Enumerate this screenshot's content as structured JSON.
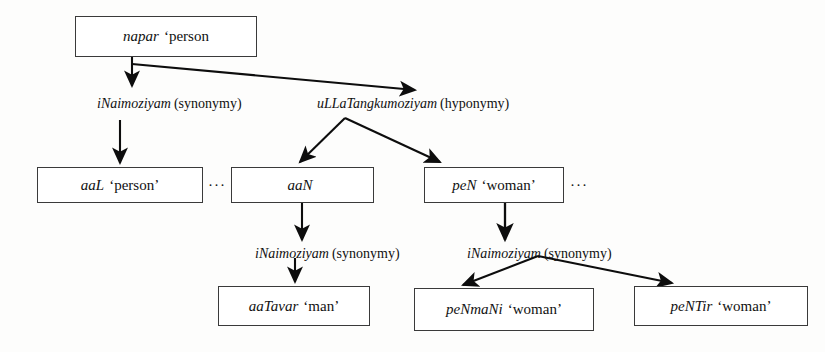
{
  "diagram": {
    "type": "tree",
    "nodes": [
      {
        "id": "napar",
        "term": "napar",
        "gloss": "‘person",
        "x": 75,
        "y": 16,
        "w": 182,
        "h": 41
      },
      {
        "id": "aaL",
        "term": "aaL",
        "gloss": "‘person’",
        "x": 37,
        "y": 167,
        "w": 166,
        "h": 36
      },
      {
        "id": "aaN",
        "term": "aaN",
        "gloss": "",
        "x": 231,
        "y": 167,
        "w": 143,
        "h": 36
      },
      {
        "id": "peN",
        "term": "peN",
        "gloss": "‘woman’",
        "x": 424,
        "y": 167,
        "w": 140,
        "h": 36
      },
      {
        "id": "aaTavar",
        "term": "aaTavar",
        "gloss": "‘man’",
        "x": 218,
        "y": 286,
        "w": 152,
        "h": 40
      },
      {
        "id": "peNmaNi",
        "term": "peNmaNi",
        "gloss": "‘woman’",
        "x": 414,
        "y": 288,
        "w": 180,
        "h": 43
      },
      {
        "id": "peNTir",
        "term": "peNTir",
        "gloss": "‘woman’",
        "x": 634,
        "y": 286,
        "w": 174,
        "h": 40
      }
    ],
    "edge_labels": [
      {
        "id": "synonymy-top",
        "rel": "iNaimoziyam",
        "kind": "(synonymy)",
        "x": 97,
        "y": 97
      },
      {
        "id": "hyponymy-top",
        "rel": "uLLaTangkumoziyam",
        "kind": "(hyponymy)",
        "x": 317,
        "y": 97
      },
      {
        "id": "synonymy-aaN",
        "rel": "iNaimoziyam",
        "kind": "(synonymy)",
        "x": 255,
        "y": 247
      },
      {
        "id": "synonymy-peN",
        "rel": "iNaimoziyam",
        "kind": "(synonymy)",
        "x": 467,
        "y": 247
      }
    ],
    "ellipses": [
      {
        "id": "ellipsis-after-aaL",
        "text": "···",
        "x": 208,
        "y": 178
      },
      {
        "id": "ellipsis-after-peN",
        "text": "···",
        "x": 570,
        "y": 178
      }
    ],
    "colors": {
      "background": "#fdfdfc",
      "box_border": "#3a3a3a",
      "text": "#111111",
      "arrow": "#0d0d0d"
    }
  }
}
